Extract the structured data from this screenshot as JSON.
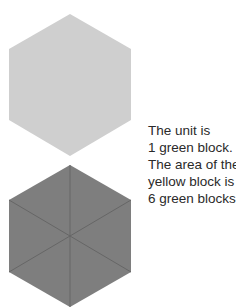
{
  "colors": {
    "yellow_block_fill": "#cfcfcf",
    "green_blocks_fill": "#7e7e7e",
    "divider_stroke": "#666666",
    "text": "#2a2a2a"
  },
  "figures": [
    {
      "name": "yellow-block",
      "shape": "hexagon",
      "center": [
        70,
        85
      ],
      "divided": false
    },
    {
      "name": "green-blocks",
      "shape": "hexagon",
      "center": [
        70,
        236
      ],
      "divided": true,
      "pieces": 6
    }
  ],
  "caption": {
    "lines": [
      "The unit is",
      "1 green block.",
      "The area of the",
      "yellow block is",
      "6 green blocks."
    ]
  }
}
